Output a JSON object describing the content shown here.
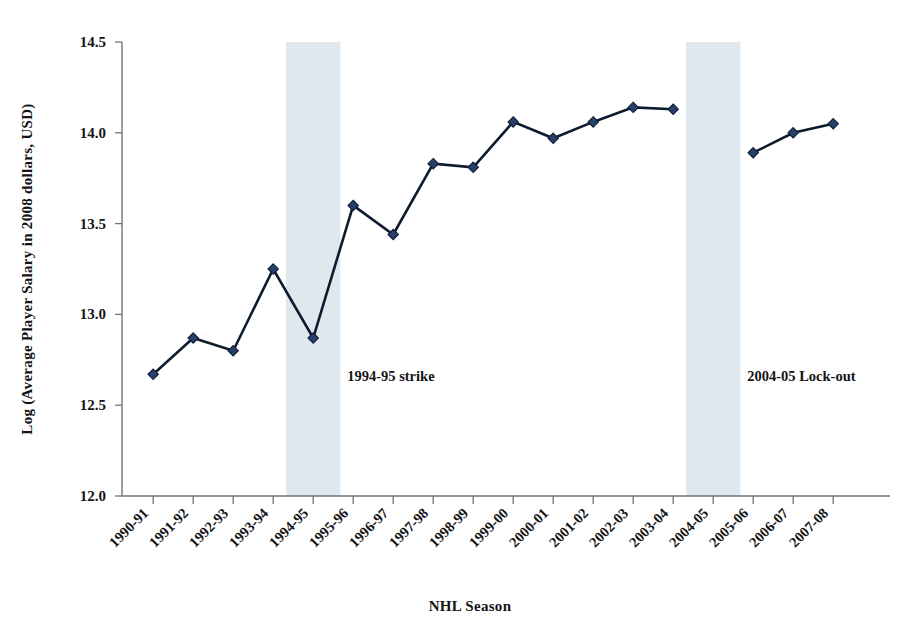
{
  "chart_data": {
    "type": "line",
    "title": "",
    "xlabel": "NHL Season",
    "ylabel": "Log (Average Player Salary in 2008 dollars, USD)",
    "ylim": [
      12.0,
      14.5
    ],
    "yticks": [
      "12.0",
      "12.5",
      "13.0",
      "13.5",
      "14.0",
      "14.5"
    ],
    "ytick_values": [
      12.0,
      12.5,
      13.0,
      13.5,
      14.0,
      14.5
    ],
    "grid": false,
    "legend": "none",
    "categories": [
      "1990-91",
      "1991-92",
      "1992-93",
      "1993-94",
      "1994-95",
      "1995-96",
      "1996-97",
      "1997-98",
      "1998-99",
      "1999-00",
      "2000-01",
      "2001-02",
      "2002-03",
      "2003-04",
      "2004-05",
      "2005-06",
      "2006-07",
      "2007-08"
    ],
    "series": [
      {
        "name": "Log average player salary",
        "values": [
          12.67,
          12.87,
          12.8,
          13.25,
          12.87,
          13.6,
          13.44,
          13.83,
          13.81,
          14.06,
          13.97,
          14.06,
          14.14,
          14.13,
          null,
          13.89,
          14.0,
          14.05
        ]
      }
    ],
    "marker_shape": "diamond",
    "marker_color": "#26406b",
    "line_color": "#0e1b2e",
    "shaded_bands": [
      {
        "name": "strike-band",
        "category": "1994-95",
        "color": "#dfe7ef"
      },
      {
        "name": "lockout-band",
        "category": "2004-05",
        "color": "#dfe7ef"
      }
    ],
    "annotations": [
      {
        "name": "strike-annotation",
        "text": "1994-95 strike"
      },
      {
        "name": "lockout-annotation",
        "text": "2004-05 Lock-out"
      }
    ]
  }
}
